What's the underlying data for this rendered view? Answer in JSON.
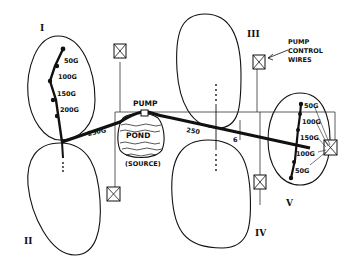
{
  "diagram": {
    "ink_color": "#111111",
    "background": "#ffffff",
    "zones": [
      {
        "id": "I",
        "label": "I"
      },
      {
        "id": "II",
        "label": "II"
      },
      {
        "id": "III",
        "label": "III"
      },
      {
        "id": "IV",
        "label": "IV"
      },
      {
        "id": "V",
        "label": "V"
      }
    ],
    "pump": {
      "label": "PUMP"
    },
    "pond": {
      "label": "POND",
      "caption": "(SOURCE)"
    },
    "control_wires": {
      "label_line1": "PUMP",
      "label_line2": "CONTROL",
      "label_line3": "WIRES"
    },
    "zone_I_valves": [
      "50G",
      "100G",
      "150G",
      "200G"
    ],
    "main_pipe_labels": [
      "250G",
      "250",
      "6"
    ],
    "zone_V_valves": [
      "50G",
      "100G",
      "150G",
      "100G",
      "50G"
    ]
  }
}
